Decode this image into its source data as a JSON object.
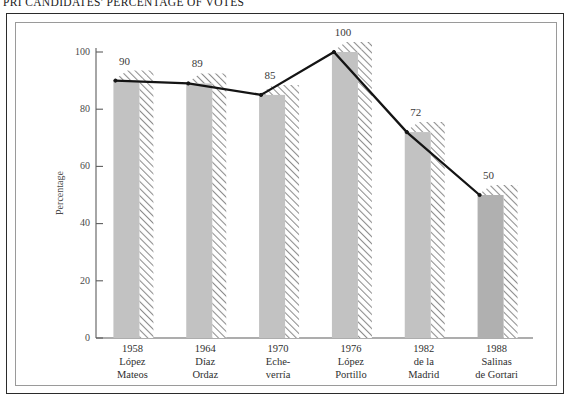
{
  "title": "PRI CANDIDATES' PERCENTAGE OF VOTES",
  "colors": {
    "bar_fill": "#c2c2c2",
    "bar_fill_last": "#b0b0b0",
    "hatch_line": "#8d8d8d",
    "line": "#141414",
    "axis": "#5d5d5d",
    "outer_frame": "#2b2b2b",
    "inner_frame": "#9a9a9a",
    "background": "#ffffff"
  },
  "chart_data": {
    "type": "bar",
    "title": "PRI CANDIDATES' PERCENTAGE OF VOTES",
    "xlabel": "",
    "ylabel": "Percentage",
    "ylim": [
      0,
      100
    ],
    "yticks": [
      0,
      20,
      40,
      60,
      80,
      100
    ],
    "ytick_labels": [
      "0",
      "20",
      "40",
      "60",
      "80",
      "100"
    ],
    "grid": false,
    "legend": "none",
    "overlay": {
      "type": "line",
      "name": "Percentage of votes",
      "values": [
        90,
        89,
        85,
        100,
        72,
        50
      ]
    },
    "categories": [
      "1958 López Mateos",
      "1964 Díaz Ordaz",
      "1970 Eche-verría",
      "1976 López Portillo",
      "1982 de la Madrid",
      "1988 Salinas de Gortari"
    ],
    "values": [
      90,
      89,
      85,
      100,
      72,
      50
    ],
    "data_labels": [
      "90",
      "89",
      "85",
      "100",
      "72",
      "50"
    ],
    "points": [
      {
        "year": "1958",
        "name_line1": "López",
        "name_line2": "Mateos",
        "value": 90
      },
      {
        "year": "1964",
        "name_line1": "Díaz",
        "name_line2": "Ordaz",
        "value": 89
      },
      {
        "year": "1970",
        "name_line1": "Eche-",
        "name_line2": "verría",
        "value": 85
      },
      {
        "year": "1976",
        "name_line1": "López",
        "name_line2": "Portillo",
        "value": 100
      },
      {
        "year": "1982",
        "name_line1": "de la",
        "name_line2": "Madrid",
        "value": 72
      },
      {
        "year": "1988",
        "name_line1": "Salinas",
        "name_line2": "de Gortari",
        "value": 50
      }
    ]
  }
}
